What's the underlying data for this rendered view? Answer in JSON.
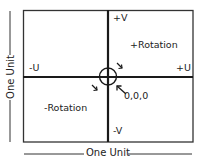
{
  "diagram": {
    "axes": {
      "positive_v": "+V",
      "negative_v": "-V",
      "positive_u": "+U",
      "negative_u": "-U"
    },
    "regions": {
      "positive_rotation": "+Rotation",
      "negative_rotation": "-Rotation"
    },
    "origin_label": "0,0,0",
    "dimensions": {
      "horizontal": "One Unit",
      "vertical": "One Unit"
    },
    "colors": {
      "line": "#1a1a1a",
      "frame": "#333333",
      "background": "#ffffff"
    }
  }
}
